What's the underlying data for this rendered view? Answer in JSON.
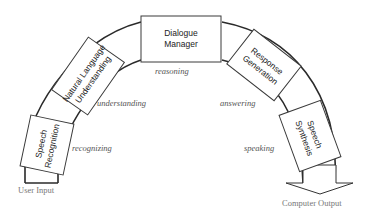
{
  "diagram": {
    "type": "spoken-dialogue-system-pipeline",
    "input_label": "User Input",
    "output_label": "Computer Output",
    "modules": [
      {
        "name": "Speech Recognition",
        "line1": "Speech",
        "line2": "Recognition",
        "stage": "recognizing"
      },
      {
        "name": "Natural Language Understanding",
        "line1": "Natural Language",
        "line2": "Understanding",
        "stage": "understanding"
      },
      {
        "name": "Dialogue Manager",
        "line1": "Dialogue",
        "line2": "Manager",
        "stage": "reasoning"
      },
      {
        "name": "Response Generation",
        "line1": "Response",
        "line2": "Generation",
        "stage": "answering"
      },
      {
        "name": "Speech Synthesis",
        "line1": "Speech",
        "line2": "Synthesis",
        "stage": "speaking"
      }
    ],
    "colors": {
      "stroke": "#3a3a3a",
      "text": "#222222",
      "stage_text": "#555555",
      "io_text": "#777777"
    }
  }
}
